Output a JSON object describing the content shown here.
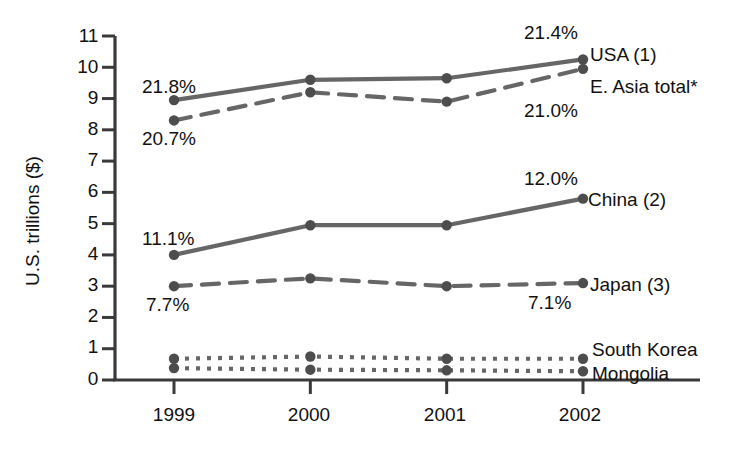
{
  "chart_data": {
    "type": "line",
    "title": "",
    "xlabel": "",
    "ylabel": "U.S. trillions ($)",
    "categories": [
      "1999",
      "2000",
      "2001",
      "2002"
    ],
    "x": [
      1999,
      2000,
      2001,
      2002
    ],
    "ylim": [
      0,
      11
    ],
    "yticks": [
      "0",
      "1",
      "2",
      "3",
      "4",
      "5",
      "6",
      "7",
      "8",
      "9",
      "10",
      "11"
    ],
    "grid": false,
    "legend_position": "right-inline-end-of-line",
    "series": [
      {
        "name": "USA (1)",
        "style": "solid",
        "values": [
          8.95,
          9.6,
          9.65,
          10.25
        ],
        "end_label": "USA (1)",
        "annotations": [
          {
            "text": "21.8%",
            "at_category": "1999",
            "position": "above-left"
          },
          {
            "text": "21.4%",
            "at_category": "2002",
            "position": "above-left"
          }
        ]
      },
      {
        "name": "E. Asia total*",
        "style": "dashed",
        "values": [
          8.3,
          9.2,
          8.9,
          9.95
        ],
        "end_label": "E. Asia total*",
        "annotations": [
          {
            "text": "20.7%",
            "at_category": "1999",
            "position": "below-left"
          },
          {
            "text": "21.0%",
            "at_category": "2002",
            "position": "below-left"
          }
        ]
      },
      {
        "name": "China (2)",
        "style": "solid",
        "values": [
          4.0,
          4.95,
          4.95,
          5.8
        ],
        "end_label": "China (2)",
        "annotations": [
          {
            "text": "11.1%",
            "at_category": "1999",
            "position": "above-left"
          },
          {
            "text": "12.0%",
            "at_category": "2002",
            "position": "above-left"
          }
        ]
      },
      {
        "name": "Japan (3)",
        "style": "dashed",
        "values": [
          3.0,
          3.25,
          3.0,
          3.1
        ],
        "end_label": "Japan (3)",
        "annotations": [
          {
            "text": "7.7%",
            "at_category": "1999",
            "position": "below-left"
          },
          {
            "text": "7.1%",
            "at_category": "2002",
            "position": "below-right"
          }
        ]
      },
      {
        "name": "South Korea",
        "style": "dotted",
        "values": [
          0.68,
          0.75,
          0.68,
          0.68
        ],
        "end_label": "South Korea",
        "annotations": []
      },
      {
        "name": "Mongolia",
        "style": "dotted",
        "values": [
          0.38,
          0.33,
          0.31,
          0.28
        ],
        "end_label": "Mongolia",
        "annotations": []
      }
    ],
    "colors": {
      "line": "#666666",
      "marker": "#4d4d4d",
      "axis": "#3a3a3a",
      "text": "#111111",
      "background": "#ffffff"
    }
  },
  "axes": {
    "y_title": "U.S. trillions ($)",
    "y_ticks": [
      "11",
      "10",
      "9",
      "8",
      "7",
      "6",
      "5",
      "4",
      "3",
      "2",
      "1",
      "0"
    ],
    "x_ticks": [
      "1999",
      "2000",
      "2001",
      "2002"
    ]
  },
  "series_labels": {
    "usa": "USA (1)",
    "easia": "E. Asia total*",
    "china": "China (2)",
    "japan": "Japan (3)",
    "korea": "South Korea",
    "mongolia": "Mongolia"
  },
  "annotations": {
    "usa_1999": "21.8%",
    "usa_2002": "21.4%",
    "easia_1999": "20.7%",
    "easia_2002": "21.0%",
    "china_1999": "11.1%",
    "china_2002": "12.0%",
    "japan_1999": "7.7%",
    "japan_2002": "7.1%"
  }
}
